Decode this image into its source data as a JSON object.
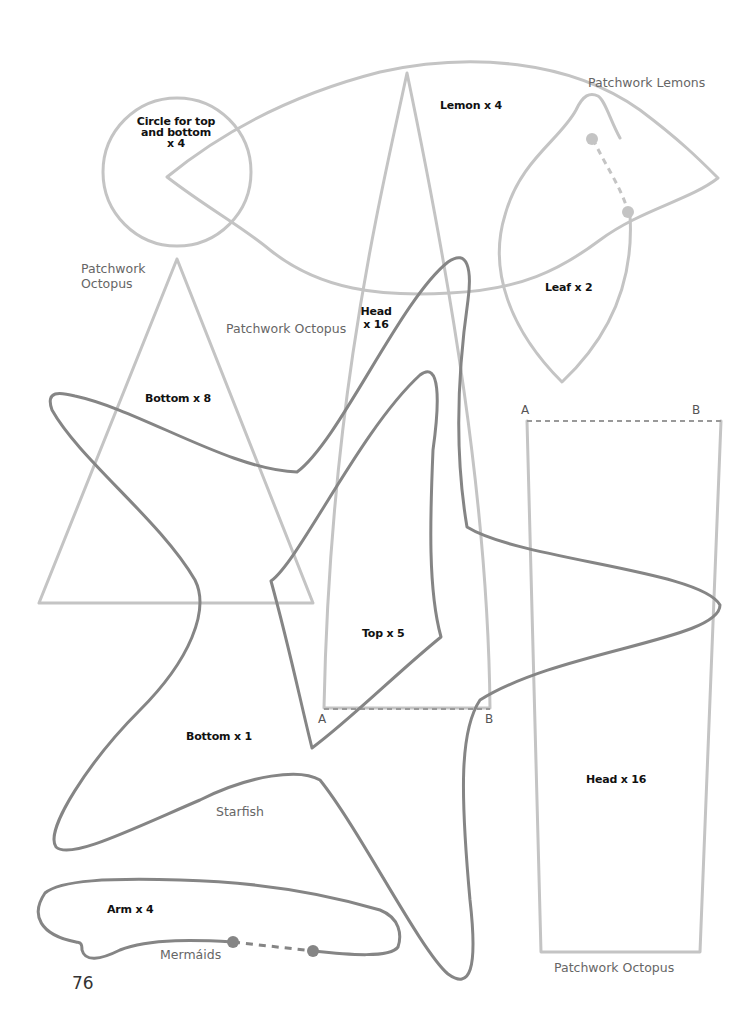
{
  "page": {
    "number": "76",
    "colors": {
      "light_outline": "#c4c4c4",
      "dark_outline": "#858585",
      "background": "#ffffff",
      "label": "#111111",
      "caption": "#666666"
    }
  },
  "patterns": {
    "lemons": {
      "caption": "Patchwork Lemons",
      "pieces": [
        {
          "name": "lemon",
          "label": "Lemon x 4"
        },
        {
          "name": "leaf",
          "label": "Leaf x 2"
        }
      ]
    },
    "octopus": {
      "captions": [
        "Patchwork\nOctopus",
        "Patchwork Octopus",
        "Patchwork Octopus"
      ],
      "pieces": [
        {
          "name": "circle",
          "label": "Circle for top\nand bottom\nx 4"
        },
        {
          "name": "bottom-triangle",
          "label": "Bottom x 8"
        },
        {
          "name": "head-cone",
          "label": "Head\nx 16"
        },
        {
          "name": "head-panel",
          "label": "Head x 16"
        }
      ],
      "markers": {
        "a": "A",
        "b": "B"
      }
    },
    "starfish": {
      "caption": "Starfish",
      "pieces": [
        {
          "name": "top",
          "label": "Top x 5"
        },
        {
          "name": "bottom",
          "label": "Bottom x 1"
        }
      ],
      "markers": {
        "a": "A",
        "b": "B"
      }
    },
    "mermaids": {
      "caption": "Mermáids",
      "pieces": [
        {
          "name": "arm",
          "label": "Arm x 4"
        }
      ]
    }
  }
}
